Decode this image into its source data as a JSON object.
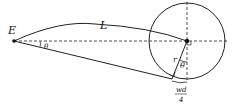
{
  "diagram": {
    "labels": {
      "point_E": "E",
      "length_L": "L",
      "angle_small": "θ",
      "radius": "r",
      "angle_center": "θ",
      "arc_num": "wd",
      "arc_den": "4"
    },
    "colors": {
      "stroke": "#222222",
      "background": "#ffffff"
    }
  }
}
